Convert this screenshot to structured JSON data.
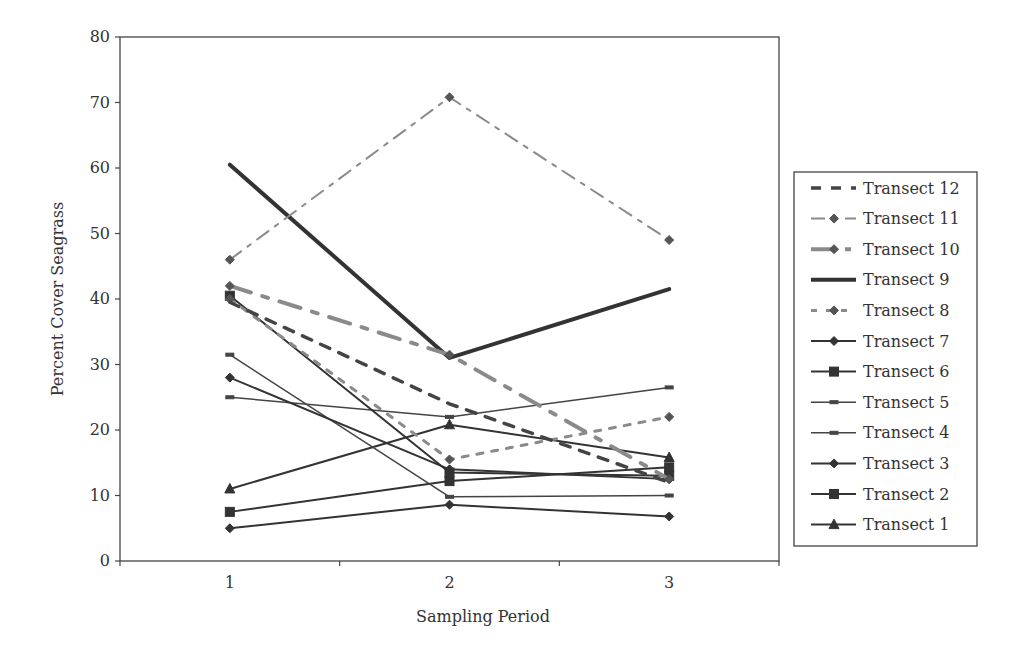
{
  "chart_data": {
    "type": "line",
    "title": "",
    "xlabel": "Sampling Period",
    "ylabel": "Percent Cover Seagrass",
    "categories": [
      "1",
      "2",
      "3"
    ],
    "x_ticks": [
      "1",
      "2",
      "3"
    ],
    "y_ticks": [
      "0",
      "10",
      "20",
      "30",
      "40",
      "50",
      "60",
      "70",
      "80"
    ],
    "ylim": [
      0,
      80
    ],
    "grid": false,
    "legend_position": "right",
    "series": [
      {
        "name": "Transect 12",
        "values": [
          39.5,
          24,
          12
        ],
        "style": "dash-bold",
        "color": "#444444",
        "marker": "none"
      },
      {
        "name": "Transect 11",
        "values": [
          46,
          70.8,
          49
        ],
        "style": "dash-dot",
        "color": "#8a8a8a",
        "marker": "diamond"
      },
      {
        "name": "Transect 10",
        "values": [
          42,
          31.5,
          12.5
        ],
        "style": "dash-thick",
        "color": "#8a8a8a",
        "marker": "diamond"
      },
      {
        "name": "Transect 9",
        "values": [
          60.5,
          31,
          41.5
        ],
        "style": "solid-thick",
        "color": "#333333",
        "marker": "none"
      },
      {
        "name": "Transect 8",
        "values": [
          40,
          15.5,
          22
        ],
        "style": "dotted",
        "color": "#8a8a8a",
        "marker": "diamond"
      },
      {
        "name": "Transect 7",
        "values": [
          28,
          14,
          12.5
        ],
        "style": "solid",
        "color": "#333333",
        "marker": "diamond"
      },
      {
        "name": "Transect 6",
        "values": [
          40.5,
          13.5,
          13
        ],
        "style": "solid",
        "color": "#333333",
        "marker": "square"
      },
      {
        "name": "Transect 5",
        "values": [
          25,
          22,
          26.5
        ],
        "style": "solid-thin",
        "color": "#444444",
        "marker": "dash"
      },
      {
        "name": "Transect 4",
        "values": [
          31.5,
          9.8,
          10
        ],
        "style": "solid-thin",
        "color": "#444444",
        "marker": "dash"
      },
      {
        "name": "Transect 3",
        "values": [
          5,
          8.6,
          6.8
        ],
        "style": "solid",
        "color": "#333333",
        "marker": "diamond"
      },
      {
        "name": "Transect 2",
        "values": [
          7.5,
          12.2,
          14.3
        ],
        "style": "solid",
        "color": "#333333",
        "marker": "square"
      },
      {
        "name": "Transect 1",
        "values": [
          11,
          20.8,
          15.8
        ],
        "style": "solid",
        "color": "#333333",
        "marker": "triangle"
      }
    ]
  }
}
